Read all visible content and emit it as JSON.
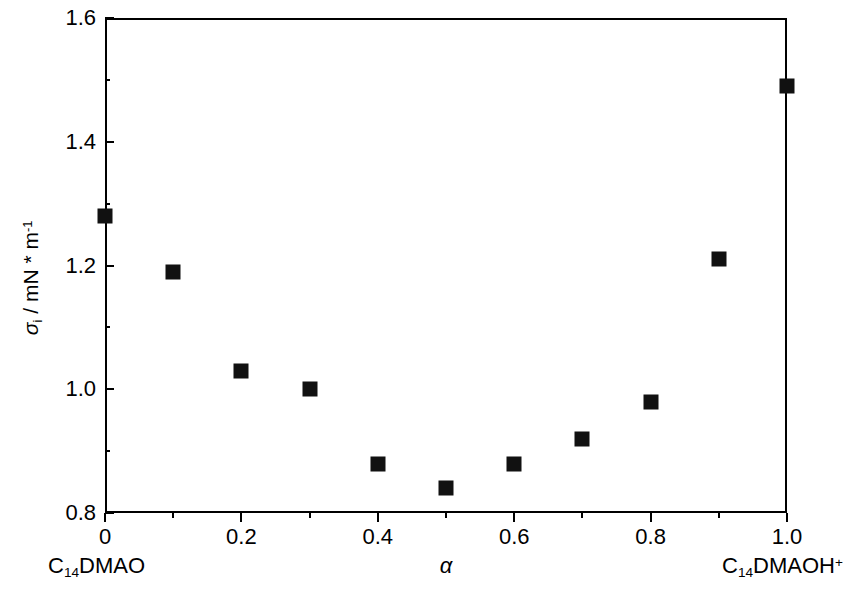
{
  "chart_data": {
    "type": "scatter",
    "title": "",
    "xlabel": "α",
    "ylabel": "σi / mN * m-1",
    "ylabel_parts": {
      "symbol": "σ",
      "subscript": "i",
      "units": " / mN * m",
      "unit_exponent": "-1"
    },
    "xlim": [
      0,
      1
    ],
    "ylim": [
      0.8,
      1.6
    ],
    "grid": false,
    "legend": null,
    "x_tick_labels": [
      "0",
      "0.2",
      "0.4",
      "0.6",
      "0.8",
      "1.0"
    ],
    "x_tick_values": [
      0,
      0.2,
      0.4,
      0.6,
      0.8,
      1.0
    ],
    "x_minor_ticks": [
      0.1,
      0.3,
      0.5,
      0.7,
      0.9
    ],
    "y_tick_labels": [
      "0.8",
      "1.0",
      "1.2",
      "1.4",
      "1.6"
    ],
    "y_tick_values": [
      0.8,
      1.0,
      1.2,
      1.4,
      1.6
    ],
    "y_minor_ticks": [
      0.9,
      1.1,
      1.3,
      1.5
    ],
    "x": [
      0,
      0.1,
      0.2,
      0.3,
      0.4,
      0.5,
      0.6,
      0.7,
      0.8,
      0.9,
      1.0
    ],
    "values": [
      1.28,
      1.19,
      1.03,
      1.0,
      0.88,
      0.84,
      0.88,
      0.92,
      0.98,
      1.21,
      1.49
    ],
    "marker": "filled-square",
    "marker_color": "#111111",
    "axis_color": "#000000",
    "annotations": [
      {
        "name": "left-endpoint",
        "text": "C14DMAO",
        "at_x": 0
      },
      {
        "name": "right-endpoint",
        "text": "C14DMAOH+",
        "at_x": 1
      }
    ]
  },
  "axis": {
    "endpoint_left": {
      "prefix": "C",
      "sub": "14",
      "suffix": "DMAO"
    },
    "endpoint_right": {
      "prefix": "C",
      "sub": "14",
      "suffix": "DMAOH",
      "sup": "+"
    }
  }
}
